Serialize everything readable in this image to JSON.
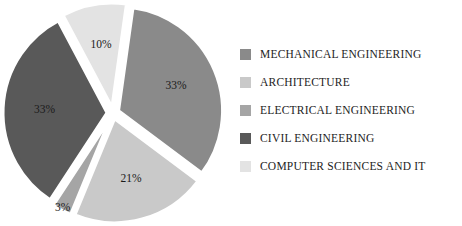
{
  "chart_data": {
    "type": "pie",
    "title": "",
    "xlabel": "",
    "ylabel": "",
    "legend_position": "right",
    "grid": false,
    "exploded": true,
    "value_suffix": "%",
    "categories": [
      "MECHANICAL ENGINEERING",
      "ARCHITECTURE",
      "ELECTRICAL ENGINEERING",
      "CIVIL ENGINEERING",
      "COMPUTER SCIENCES AND IT"
    ],
    "values": [
      33,
      21,
      3,
      33,
      10
    ],
    "labels": [
      "33%",
      "21%",
      "3%",
      "33%",
      "10%"
    ],
    "colors": [
      "#8a8a8a",
      "#c9c9c9",
      "#a5a5a5",
      "#595959",
      "#e3e3e3"
    ],
    "slices": [
      {
        "name": "MECHANICAL ENGINEERING",
        "value": 33,
        "label": "33%",
        "color": "#8a8a8a"
      },
      {
        "name": "ARCHITECTURE",
        "value": 21,
        "label": "21%",
        "color": "#c9c9c9"
      },
      {
        "name": "ELECTRICAL ENGINEERING",
        "value": 3,
        "label": "3%",
        "color": "#a5a5a5"
      },
      {
        "name": "CIVIL ENGINEERING",
        "value": 33,
        "label": "33%",
        "color": "#595959"
      },
      {
        "name": "COMPUTER SCIENCES AND IT",
        "value": 10,
        "label": "10%",
        "color": "#e3e3e3"
      }
    ]
  },
  "legend": {
    "items": [
      {
        "label": "MECHANICAL ENGINEERING",
        "color": "#8a8a8a"
      },
      {
        "label": "ARCHITECTURE",
        "color": "#c9c9c9"
      },
      {
        "label": "ELECTRICAL ENGINEERING",
        "color": "#a5a5a5"
      },
      {
        "label": "CIVIL ENGINEERING",
        "color": "#595959"
      },
      {
        "label": "COMPUTER SCIENCES AND IT",
        "color": "#e3e3e3"
      }
    ]
  }
}
